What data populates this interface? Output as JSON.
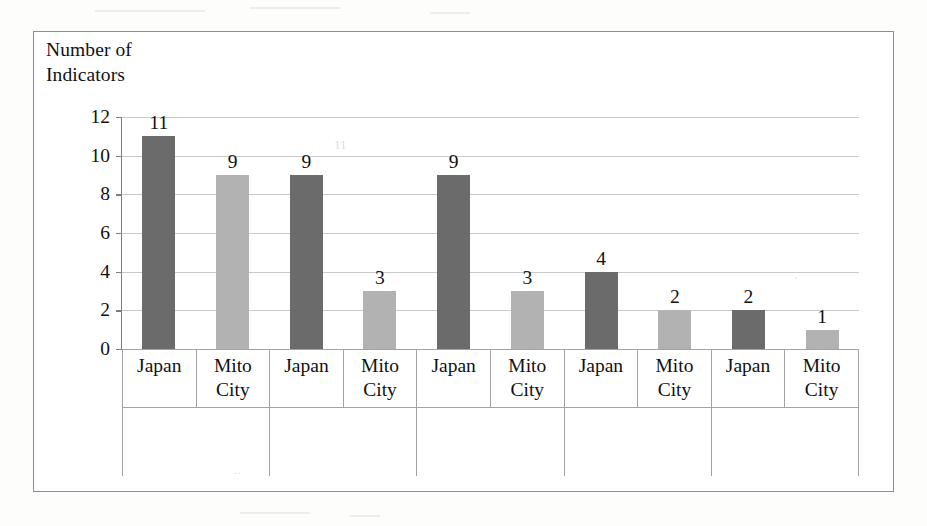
{
  "axis_title": "Number of\nIndicators",
  "colors": {
    "japan_bar": "#6b6b6b",
    "mito_bar": "#b2b2b2",
    "gridline": "#c9c9c9",
    "frame": "#8d8d8d",
    "table_border": "#a3a3a3",
    "text": "#111111",
    "page_background": "#fdfdfc"
  },
  "y_axis": {
    "label": "Number of Indicators",
    "ticks": [
      "0",
      "2",
      "4",
      "6",
      "8",
      "10",
      "12"
    ],
    "min": 0,
    "max": 12,
    "step": 2
  },
  "series_labels": {
    "japan": "Japan",
    "mito": "Mito\nCity"
  },
  "categories": [
    {
      "label": "I  Economy"
    },
    {
      "label": "II  Education"
    },
    {
      "label": "III  Health"
    },
    {
      "label": "IV  Public life"
    },
    {
      "label": "V  Human\nrights"
    }
  ],
  "bars": [
    {
      "group": "I  Economy",
      "series": "Japan",
      "value": 11,
      "value_label": "11"
    },
    {
      "group": "I  Economy",
      "series": "Mito City",
      "value": 9,
      "value_label": "9"
    },
    {
      "group": "II  Education",
      "series": "Japan",
      "value": 9,
      "value_label": "9"
    },
    {
      "group": "II  Education",
      "series": "Mito City",
      "value": 3,
      "value_label": "3"
    },
    {
      "group": "III  Health",
      "series": "Japan",
      "value": 9,
      "value_label": "9"
    },
    {
      "group": "III  Health",
      "series": "Mito City",
      "value": 3,
      "value_label": "3"
    },
    {
      "group": "IV  Public life",
      "series": "Japan",
      "value": 4,
      "value_label": "4"
    },
    {
      "group": "IV  Public life",
      "series": "Mito City",
      "value": 2,
      "value_label": "2"
    },
    {
      "group": "V  Human rights",
      "series": "Japan",
      "value": 2,
      "value_label": "2"
    },
    {
      "group": "V  Human rights",
      "series": "Mito City",
      "value": 1,
      "value_label": "1"
    }
  ],
  "chart_data": {
    "type": "bar",
    "title": "",
    "xlabel": "",
    "ylabel": "Number of Indicators",
    "ylim": [
      0,
      12
    ],
    "ytick_step": 2,
    "grid": true,
    "legend": "none",
    "categories": [
      "I  Economy",
      "II  Education",
      "III  Health",
      "IV  Public life",
      "V  Human rights"
    ],
    "series": [
      {
        "name": "Japan",
        "color": "#6b6b6b",
        "values": [
          11,
          9,
          9,
          4,
          2
        ]
      },
      {
        "name": "Mito City",
        "color": "#b2b2b2",
        "values": [
          9,
          3,
          3,
          2,
          1
        ]
      }
    ],
    "data_labels": [
      11,
      9,
      9,
      3,
      9,
      3,
      4,
      2,
      2,
      1
    ],
    "tick_labels": [
      "0",
      "2",
      "4",
      "6",
      "8",
      "10",
      "12"
    ]
  }
}
